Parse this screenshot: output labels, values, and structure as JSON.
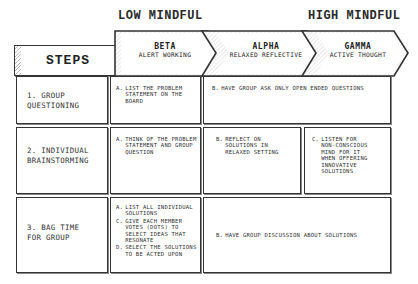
{
  "top_labels": {
    "low": "LOW MINDFUL",
    "high": "HIGH MINDFUL"
  },
  "header": {
    "steps": "STEPS",
    "phases": [
      {
        "title": "BETA",
        "subtitle": "ALERT WORKING"
      },
      {
        "title": "ALPHA",
        "subtitle": "RELAXED REFLECTIVE"
      },
      {
        "title": "GAMMA",
        "subtitle": "ACTIVE THOUGHT"
      }
    ]
  },
  "rows": [
    {
      "step": "1. GROUP QUESTIONING",
      "beta": [
        {
          "marker": "A.",
          "text": "LIST THE PROBLEM STATEMENT ON THE BOARD"
        }
      ],
      "merged": {
        "marker": "B.",
        "text": "HAVE GROUP ASK ONLY OPEN ENDED QUESTIONS"
      }
    },
    {
      "step": "2. INDIVIDUAL BRAINSTORMING",
      "beta": [
        {
          "marker": "A.",
          "text": "THINK OF THE PROBLEM STATEMENT AND GROUP QUESTION"
        }
      ],
      "alpha": {
        "marker": "B.",
        "text": "REFLECT ON SOLUTIONS IN RELAXED SETTING"
      },
      "gamma": {
        "marker": "C.",
        "text": "LISTEN FOR NON-CONSCIOUS MIND FOR IT WHEN OFFERING INNOVATIVE SOLUTIONS"
      }
    },
    {
      "step": "3. BAG TIME FOR GROUP",
      "beta": [
        {
          "marker": "A.",
          "text": "LIST ALL INDIVIDUAL SOLUTIONS"
        },
        {
          "marker": "C.",
          "text": "GIVE EACH MEMBER VOTES (DOTS) TO SELECT IDEAS THAT RESONATE"
        },
        {
          "marker": "D.",
          "text": "SELECT THE SOLUTIONS TO BE ACTED UPON"
        }
      ],
      "merged": {
        "marker": "B.",
        "text": "HAVE GROUP DISCUSSION ABOUT SOLUTIONS"
      }
    }
  ],
  "colors": {
    "line": "#333333",
    "hatch": "#bbbbbb",
    "background": "#ffffff"
  }
}
